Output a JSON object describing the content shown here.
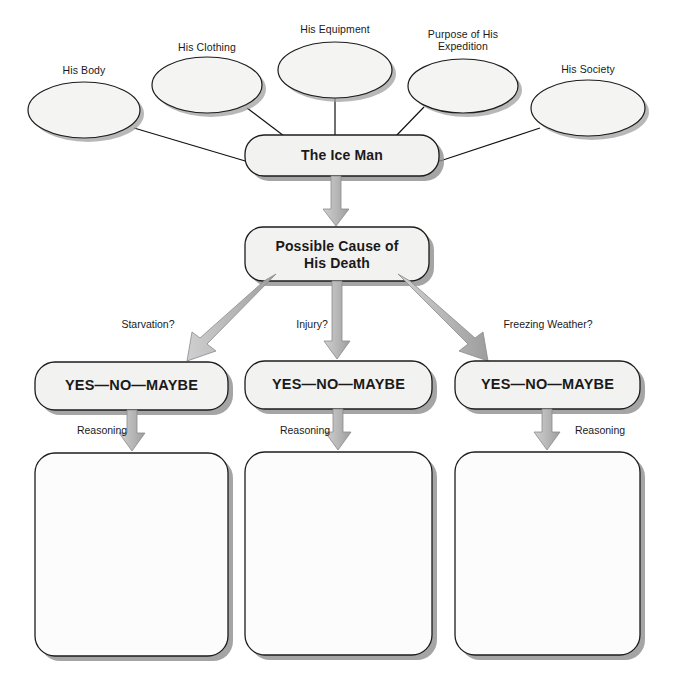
{
  "diagram": {
    "colors": {
      "page_background": "#ffffff",
      "shape_fill": "#f3f3f2",
      "empty_box_fill": "#fcfcfc",
      "shape_stroke": "#1c1c1c",
      "shadow": "#9a9a9a",
      "arrow_fill": "#b3b3b3",
      "arrow_stroke": "#7d7d7d",
      "connector_line": "#111111",
      "text": "#1a1a1a"
    },
    "topic_ellipses": [
      {
        "label": "His Body",
        "cx": 84,
        "cy": 110,
        "rx": 56,
        "ry": 28,
        "caption_x": 84,
        "caption_y": 64
      },
      {
        "label": "His Clothing",
        "cx": 207,
        "cy": 85,
        "rx": 55,
        "ry": 28,
        "caption_x": 207,
        "caption_y": 41
      },
      {
        "label": "His Equipment",
        "cx": 335,
        "cy": 70,
        "rx": 57,
        "ry": 28,
        "caption_x": 335,
        "caption_y": 23
      },
      {
        "label": "Purpose of His\nExpedition",
        "cx": 463,
        "cy": 86,
        "rx": 55,
        "ry": 27,
        "caption_x": 463,
        "caption_y": 28
      },
      {
        "label": "His Society",
        "cx": 588,
        "cy": 108,
        "rx": 57,
        "ry": 28,
        "caption_x": 588,
        "caption_y": 63
      }
    ],
    "center_node": {
      "label": "The Ice Man",
      "x": 245,
      "y": 135,
      "w": 194,
      "h": 41
    },
    "cause_node": {
      "label": "Possible Cause of\nHis Death",
      "x": 245,
      "y": 227,
      "w": 184,
      "h": 54
    },
    "branches": [
      {
        "question": "Starvation?",
        "question_x": 148,
        "question_y": 318,
        "verdict": "YES—NO—MAYBE",
        "verdict_box": {
          "x": 35,
          "y": 362,
          "w": 193,
          "h": 48
        },
        "reasoning_label": "Reasoning",
        "reasoning_x": 102,
        "reasoning_y": 426,
        "answer_box": {
          "x": 35,
          "y": 453,
          "w": 193,
          "h": 203
        }
      },
      {
        "question": "Injury?",
        "question_x": 312,
        "question_y": 318,
        "verdict": "YES—NO—MAYBE",
        "verdict_box": {
          "x": 245,
          "y": 361,
          "w": 187,
          "h": 48
        },
        "reasoning_label": "Reasoning",
        "reasoning_x": 305,
        "reasoning_y": 426,
        "answer_box": {
          "x": 245,
          "y": 452,
          "w": 187,
          "h": 203
        }
      },
      {
        "question": "Freezing Weather?",
        "question_x": 548,
        "question_y": 318,
        "verdict": "YES—NO—MAYBE",
        "verdict_box": {
          "x": 455,
          "y": 361,
          "w": 185,
          "h": 48
        },
        "reasoning_label": "Reasoning",
        "reasoning_x": 588,
        "reasoning_y": 426,
        "answer_box": {
          "x": 455,
          "y": 452,
          "w": 185,
          "h": 203
        }
      }
    ]
  }
}
